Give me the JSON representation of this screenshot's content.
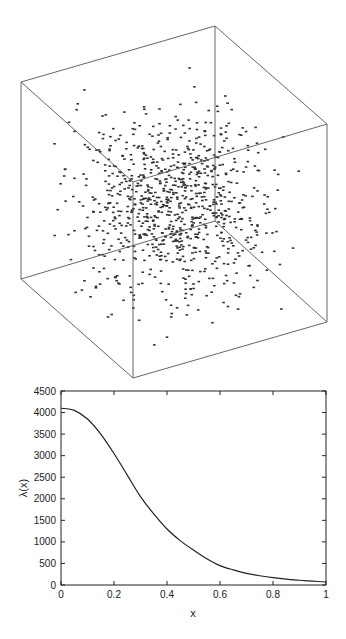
{
  "chart_data": [
    {
      "type": "scatter",
      "title": "",
      "description": "3D point cloud inside a wireframe cube, points concentrated toward the cube center",
      "point_count": 900,
      "distribution": "centrally concentrated (Gaussian-like) within unit cube",
      "axes_visible": false,
      "point_color": "#333333",
      "frame_color": "#555555"
    },
    {
      "type": "line",
      "title": "",
      "xlabel": "x",
      "ylabel": "λ(x)",
      "xlim": [
        0,
        1
      ],
      "ylim": [
        0,
        4500
      ],
      "xticks": [
        "0",
        "0.2",
        "0.4",
        "0.6",
        "0.8",
        "1"
      ],
      "yticks": [
        "0",
        "500",
        "1000",
        "1500",
        "2000",
        "2500",
        "3000",
        "3500",
        "4000",
        "4500"
      ],
      "grid": false,
      "legend": "none",
      "series": [
        {
          "name": "λ(x)",
          "color": "#222222",
          "x": [
            0,
            0.05,
            0.1,
            0.15,
            0.2,
            0.25,
            0.3,
            0.35,
            0.4,
            0.45,
            0.5,
            0.55,
            0.6,
            0.65,
            0.7,
            0.75,
            0.8,
            0.85,
            0.9,
            0.95,
            1.0
          ],
          "y": [
            4100,
            4050,
            3850,
            3500,
            3050,
            2550,
            2050,
            1650,
            1300,
            1030,
            810,
            610,
            450,
            350,
            270,
            215,
            170,
            135,
            110,
            88,
            70
          ]
        }
      ]
    }
  ]
}
